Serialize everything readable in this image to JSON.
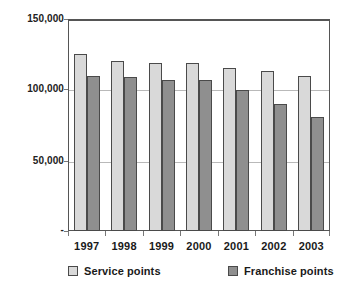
{
  "chart_data": {
    "type": "bar",
    "title": "",
    "xlabel": "",
    "ylabel": "",
    "categories": [
      "1997",
      "1998",
      "1999",
      "2000",
      "2001",
      "2002",
      "2003"
    ],
    "series": [
      {
        "name": "Service points",
        "color": "#d9d9d9",
        "values": [
          125000,
          120000,
          119000,
          119000,
          115000,
          113000,
          110000
        ]
      },
      {
        "name": "Franchise points",
        "color": "#8f8f8f",
        "values": [
          110000,
          109000,
          107000,
          107000,
          100000,
          90000,
          81000
        ]
      }
    ],
    "ylim": [
      0,
      150000
    ],
    "ytick_labels": [
      "150,000",
      "100,000",
      "50,000",
      "-"
    ],
    "ytick_values": [
      150000,
      100000,
      50000,
      0
    ],
    "grid": true,
    "legend_position": "bottom"
  },
  "legend": {
    "items": [
      {
        "label": "Service points",
        "swatch": "legend-swatch-service"
      },
      {
        "label": "Franchise points",
        "swatch": "legend-swatch-franchise"
      }
    ]
  }
}
